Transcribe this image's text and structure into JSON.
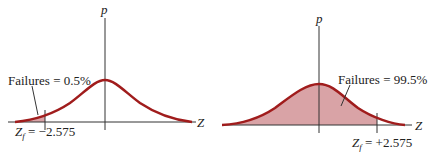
{
  "colors": {
    "curve": "#a01c1c",
    "fill": "#d9a3a6",
    "axis": "#333333",
    "text": "#222222"
  },
  "left_panel": {
    "y_axis_label": "p",
    "x_axis_label": "Z",
    "annotation": "Failures = 0.5%",
    "z_label_prefix": "Z",
    "z_label_sub": "f",
    "z_label_value": " = −2.575",
    "shaded_region": "left tail"
  },
  "right_panel": {
    "y_axis_label": "p",
    "x_axis_label": "Z",
    "annotation": "Failures = 99.5%",
    "z_label_prefix": "Z",
    "z_label_sub": "f",
    "z_label_value": " = +2.575",
    "shaded_region": "area left of cutoff"
  }
}
